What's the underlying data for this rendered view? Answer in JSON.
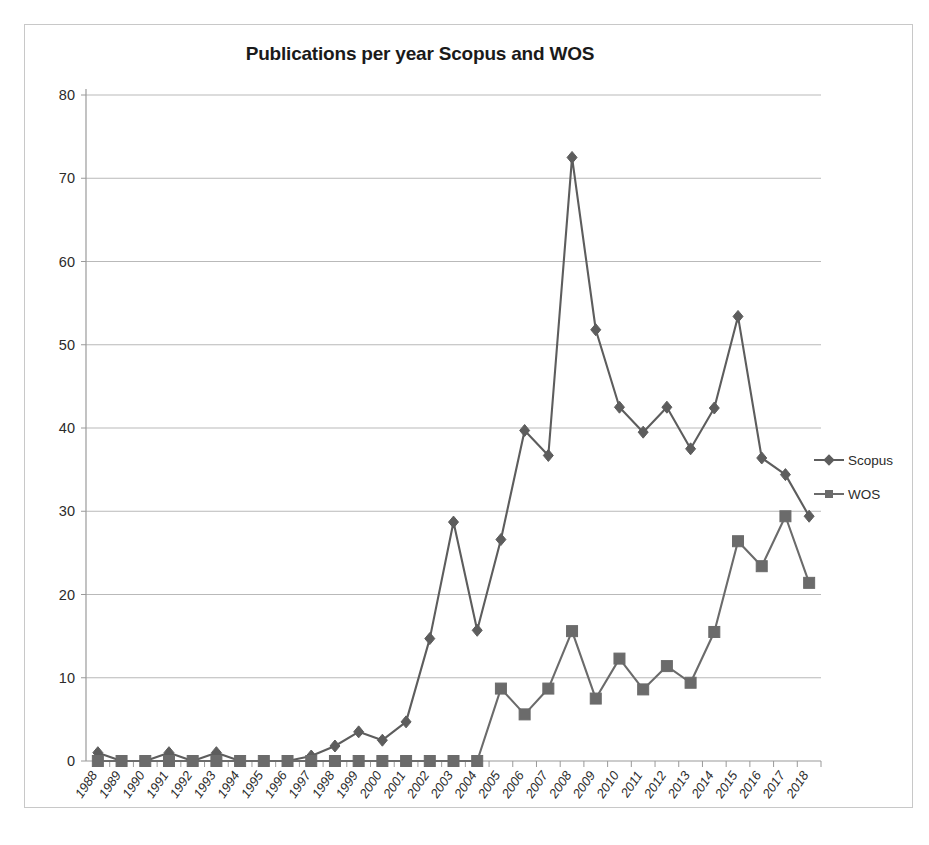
{
  "chart_data": {
    "type": "line",
    "title": "Publications per year Scopus and WOS",
    "xlabel": "",
    "ylabel": "",
    "ylim": [
      0,
      80
    ],
    "yticks": [
      0,
      10,
      20,
      30,
      40,
      50,
      60,
      70,
      80
    ],
    "grid": true,
    "legend_position": "right",
    "categories": [
      "1988",
      "1989",
      "1990",
      "1991",
      "1992",
      "1993",
      "1994",
      "1995",
      "1996",
      "1997",
      "1998",
      "1999",
      "2000",
      "2001",
      "2002",
      "2003",
      "2004",
      "2005",
      "2006",
      "2007",
      "2008",
      "2009",
      "2010",
      "2011",
      "2012",
      "2013",
      "2014",
      "2015",
      "2016",
      "2017",
      "2018"
    ],
    "series": [
      {
        "name": "Scopus",
        "marker": "diamond",
        "color": "#5d5d5d",
        "values": [
          1.0,
          0.0,
          0.0,
          1.0,
          0.0,
          1.0,
          0.0,
          0.0,
          0.0,
          0.6,
          1.8,
          3.5,
          2.5,
          4.7,
          14.7,
          28.7,
          15.7,
          26.6,
          39.7,
          36.7,
          72.5,
          51.8,
          42.5,
          39.5,
          42.5,
          37.5,
          42.4,
          53.4,
          36.4,
          34.4,
          29.4
        ]
      },
      {
        "name": "WOS",
        "marker": "square",
        "color": "#6b6b6b",
        "values": [
          0.0,
          0.0,
          0.0,
          0.0,
          0.0,
          0.0,
          0.0,
          0.0,
          0.0,
          0.0,
          0.0,
          0.0,
          0.0,
          0.0,
          0.0,
          0.0,
          0.0,
          8.7,
          5.6,
          8.7,
          15.6,
          7.5,
          12.3,
          8.6,
          11.4,
          9.4,
          15.5,
          26.4,
          23.4,
          29.4,
          21.4
        ]
      }
    ]
  },
  "legend": {
    "items": [
      {
        "label": "Scopus"
      },
      {
        "label": "WOS"
      }
    ]
  }
}
